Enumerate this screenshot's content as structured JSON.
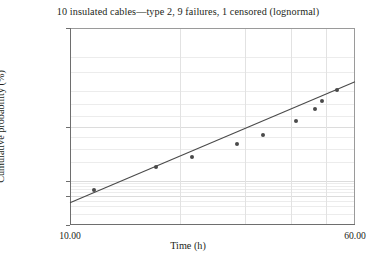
{
  "chart_data": {
    "type": "scatter",
    "title": "10 insulated cables—type 2, 9 failures, 1 censored (lognormal)",
    "xlabel": "Time (h)",
    "ylabel": "Cumulative probability (%)",
    "xscale": "log",
    "yscale": "probability",
    "xlim": [
      10.0,
      60.0
    ],
    "ylim": [
      1.0,
      99.0
    ],
    "grid": true,
    "legend": "none",
    "xticks": [
      {
        "value": 10.0,
        "label": "10.00"
      },
      {
        "value": 60.0,
        "label": "60.00"
      }
    ],
    "xgridlines": [
      20,
      30,
      40,
      50
    ],
    "yticks": [
      {
        "value": 99.0,
        "label": "99.00"
      },
      {
        "value": 50.0,
        "label": "50.00"
      },
      {
        "value": 10.0,
        "label": "10.00"
      },
      {
        "value": 5.0,
        "label": "5.00"
      },
      {
        "value": 1.0,
        "label": "1.00"
      }
    ],
    "ygridlines": [
      2,
      3,
      4,
      6,
      7,
      8,
      9,
      20,
      30,
      40,
      60,
      70,
      80,
      90,
      95
    ],
    "series": [
      {
        "name": "failure-points",
        "marker": "circle",
        "color": "#4a4a4a",
        "points": [
          {
            "x": 11.6,
            "y": 6.7
          },
          {
            "x": 17.2,
            "y": 17.0
          },
          {
            "x": 21.5,
            "y": 23.5
          },
          {
            "x": 28.5,
            "y": 34.0
          },
          {
            "x": 33.6,
            "y": 42.5
          },
          {
            "x": 41.5,
            "y": 55.0
          },
          {
            "x": 46.5,
            "y": 66.0
          },
          {
            "x": 48.8,
            "y": 72.5
          },
          {
            "x": 53.5,
            "y": 80.5
          }
        ]
      },
      {
        "name": "lognormal-fit-line",
        "marker": "none",
        "color": "#4a4a4a",
        "endpoints": [
          {
            "x": 10.0,
            "y": 3.6
          },
          {
            "x": 60.0,
            "y": 85.5
          }
        ]
      }
    ]
  }
}
